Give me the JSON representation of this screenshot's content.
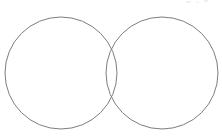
{
  "document": {
    "kind": "venn-diagram",
    "title": "",
    "background_color": "#ffffff",
    "width": 222,
    "height": 139
  },
  "diagram": {
    "stroke_color": "#7d7d82",
    "stroke_width": 1,
    "fill": "none",
    "circles": [
      {
        "name": "left-set",
        "label": "",
        "cx": 61,
        "cy": 73,
        "r": 56
      },
      {
        "name": "right-set",
        "label": "",
        "cx": 162,
        "cy": 73,
        "r": 56
      }
    ],
    "regions": {
      "left_only_label": "",
      "intersection_label": "",
      "right_only_label": ""
    },
    "intersection_points": [
      {
        "x": 114,
        "y": 24
      },
      {
        "x": 114,
        "y": 122
      }
    ]
  },
  "artifacts": {
    "note": "faint scanner specks near top-right edge",
    "specks": [
      {
        "x": 186,
        "y": 1,
        "w": 5,
        "h": 2
      },
      {
        "x": 196,
        "y": 2,
        "w": 3,
        "h": 1
      },
      {
        "x": 204,
        "y": 0,
        "w": 4,
        "h": 2
      }
    ]
  }
}
